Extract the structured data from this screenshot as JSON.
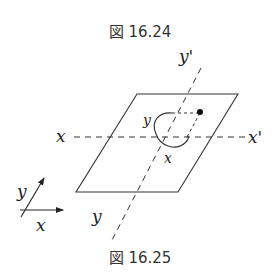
{
  "captions": {
    "top": "図 16.24",
    "bottom": "図 16.25"
  },
  "labels": {
    "y_prime": "y'",
    "x_left": "x",
    "x_prime": "x'",
    "y_bottom": "y",
    "rot_y": "y",
    "rot_x": "x",
    "ref_y": "y",
    "ref_x": "x"
  }
}
